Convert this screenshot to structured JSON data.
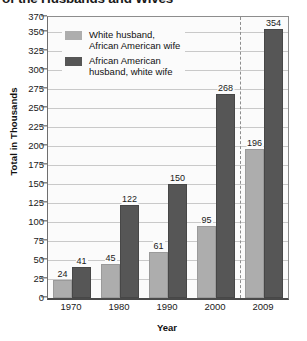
{
  "chart_data": {
    "type": "bar",
    "title": "of the Husbands and Wives",
    "xlabel": "Year",
    "ylabel": "Total in Thousands",
    "categories": [
      "1970",
      "1980",
      "1990",
      "2000",
      "2009"
    ],
    "series": [
      {
        "name": "White husband,\nAfrican American wife",
        "color": "#adadad",
        "values": [
          24,
          45,
          61,
          95,
          196
        ]
      },
      {
        "name": "African American\nhusband, white wife",
        "color": "#565656",
        "values": [
          41,
          122,
          150,
          268,
          354
        ]
      }
    ],
    "ylim": [
      0,
      370
    ],
    "yticks": [
      0,
      25,
      50,
      75,
      100,
      125,
      150,
      175,
      200,
      225,
      250,
      275,
      300,
      325,
      350,
      370
    ],
    "grid": true,
    "legend_position": "inside-top-left",
    "annotations": [
      {
        "type": "vertical-dashed-line",
        "between": [
          "2000",
          "2009"
        ]
      }
    ],
    "data_labels": true
  },
  "colors": {
    "series_light": "#adadad",
    "series_dark": "#565656",
    "gridline": "#c9c9c9",
    "axis": "#4a4a4a",
    "plot_background": "#fbfbfb",
    "text": "#1a1a1a"
  }
}
